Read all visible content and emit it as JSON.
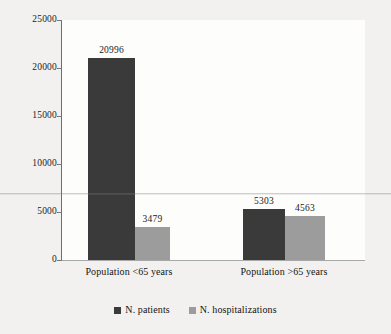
{
  "chart_data": {
    "type": "bar",
    "title": "",
    "subtitle": "",
    "xlabel": "",
    "ylabel": "",
    "categories": [
      "Population <65 years",
      "Population >65 years"
    ],
    "series": [
      {
        "name": "N. patients",
        "color": "#3a3a3a",
        "values": [
          20996,
          5303
        ]
      },
      {
        "name": "N. hospitalizations",
        "color": "#9c9c9c",
        "values": [
          3479,
          4563
        ]
      }
    ],
    "value_labels": [
      [
        "20996",
        "5303"
      ],
      [
        "3479",
        "4563"
      ]
    ],
    "ylim": [
      0,
      25000
    ],
    "yticks": [
      0,
      5000,
      10000,
      15000,
      20000,
      25000
    ],
    "ytick_labels": [
      "0",
      "5000",
      "10000",
      "15000",
      "20000",
      "25000"
    ],
    "grid": false,
    "legend_position": "bottom"
  },
  "axis": {
    "ticks": [
      {
        "label": "25000",
        "value": 25000
      },
      {
        "label": "20000",
        "value": 20000
      },
      {
        "label": "15000",
        "value": 15000
      },
      {
        "label": "10000",
        "value": 10000
      },
      {
        "label": "5000",
        "value": 5000
      },
      {
        "label": "0",
        "value": 0
      }
    ]
  },
  "groups": [
    {
      "label": "Population <65 years",
      "bars": [
        {
          "series": "N. patients",
          "label": "20996"
        },
        {
          "series": "N. hospitalizations",
          "label": "3479"
        }
      ]
    },
    {
      "label": "Population >65 years",
      "bars": [
        {
          "series": "N. patients",
          "label": "5303"
        },
        {
          "series": "N. hospitalizations",
          "label": "4563"
        }
      ]
    }
  ],
  "legend": {
    "items": [
      {
        "label": "N. patients",
        "color": "#3a3a3a"
      },
      {
        "label": "N. hospitalizations",
        "color": "#9c9c9c"
      }
    ]
  },
  "colors": {
    "series_dark": "#3a3a3a",
    "series_light": "#9c9c9c",
    "background": "#f2f1ef",
    "plot_background": "#fdfdfc",
    "axis": "#6e6e6e",
    "text": "#1a1a1a"
  }
}
